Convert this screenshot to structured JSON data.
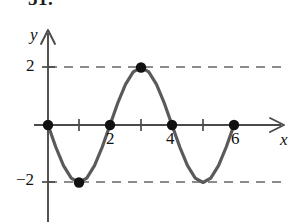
{
  "figure": {
    "problem_number": "51.",
    "axis_labels": {
      "x": "x",
      "y": "y"
    },
    "y_tick_labels": [
      {
        "value": 2,
        "text": "2"
      },
      {
        "value": -2,
        "text": "−2"
      }
    ],
    "x_tick_labels": [
      {
        "value": 2,
        "text": "2"
      },
      {
        "value": 4,
        "text": "4"
      },
      {
        "value": 6,
        "text": "6"
      }
    ],
    "colors": {
      "curve": "#5a5a5a",
      "axis": "#4a4a4a",
      "dashed_guide": "#8c8c8c",
      "point": "#111111",
      "background": "#ffffff"
    }
  },
  "chart_data": {
    "type": "line",
    "title": "",
    "subtitle": "",
    "xlabel": "x",
    "ylabel": "y",
    "xlim": [
      -0.45,
      7.6
    ],
    "ylim": [
      -3.1,
      3.1
    ],
    "grid": false,
    "legend": null,
    "function_description": "y = -2 sin(pi x / 2)",
    "series": [
      {
        "name": "curve",
        "x": [
          0,
          0.25,
          0.5,
          0.75,
          1,
          1.25,
          1.5,
          1.75,
          2,
          2.25,
          2.5,
          2.75,
          3,
          3.25,
          3.5,
          3.75,
          4,
          4.25,
          4.5,
          4.75,
          5,
          5.25,
          5.5,
          5.75,
          6
        ],
        "y": [
          0,
          -0.765,
          -1.414,
          -1.848,
          -2,
          -1.848,
          -1.414,
          -0.765,
          0,
          0.765,
          1.414,
          1.848,
          2,
          1.848,
          1.414,
          0.765,
          0,
          -0.765,
          -1.414,
          -1.848,
          -2,
          -1.848,
          -1.414,
          -0.765,
          0
        ]
      }
    ],
    "marked_points": [
      {
        "x": 0,
        "y": 0
      },
      {
        "x": 1,
        "y": -2
      },
      {
        "x": 2,
        "y": 0
      },
      {
        "x": 3,
        "y": 2
      },
      {
        "x": 4,
        "y": 0
      },
      {
        "x": 6,
        "y": 0
      }
    ],
    "x_ticks": [
      1,
      2,
      3,
      4,
      5,
      6
    ],
    "y_ticks": [
      2,
      -2
    ],
    "guide_lines": [
      {
        "axis": "horizontal",
        "value": 2,
        "style": "dashed"
      },
      {
        "axis": "horizontal",
        "value": -2,
        "style": "dashed"
      }
    ]
  }
}
